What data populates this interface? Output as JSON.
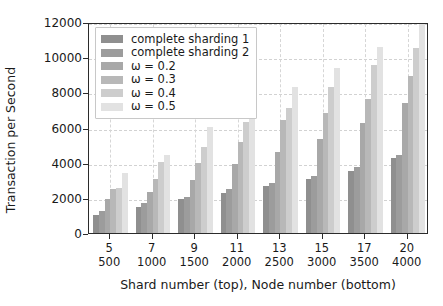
{
  "chart_data": {
    "type": "bar",
    "title": "",
    "xlabel": "Shard number (top), Node number (bottom)",
    "ylabel": "Transaction per Second",
    "categories": [
      "5\n500",
      "7\n1000",
      "9\n1500",
      "11\n2000",
      "13\n2500",
      "15\n3000",
      "17\n3500",
      "20\n4000"
    ],
    "shard_numbers": [
      "5",
      "7",
      "9",
      "11",
      "13",
      "15",
      "17",
      "20"
    ],
    "node_numbers": [
      "500",
      "1000",
      "1500",
      "2000",
      "2500",
      "3000",
      "3500",
      "4000"
    ],
    "ylim": [
      0,
      12000
    ],
    "yticks": [
      0,
      2000,
      4000,
      6000,
      8000,
      10000,
      12000
    ],
    "ytick_labels": [
      "0",
      "2000",
      "4000",
      "6000",
      "8000",
      "10000",
      "12000"
    ],
    "grid": true,
    "legend_position": "upper left",
    "series": [
      {
        "name": "complete sharding 1",
        "color": "#8f8f8f",
        "values": [
          1050,
          1500,
          1950,
          2300,
          2700,
          3100,
          3500,
          4250
        ]
      },
      {
        "name": "complete sharding 2",
        "color": "#9c9c9c",
        "values": [
          1280,
          1700,
          2050,
          2500,
          2850,
          3250,
          3750,
          4450
        ]
      },
      {
        "name": "ω = 0.2",
        "color": "#a8a8a8",
        "values": [
          1950,
          2350,
          3000,
          3900,
          4600,
          5350,
          6250,
          7400
        ]
      },
      {
        "name": "ω = 0.3",
        "color": "#b8b8b8",
        "values": [
          2500,
          3100,
          4000,
          5200,
          6400,
          6800,
          7650,
          8950
        ]
      },
      {
        "name": "ω = 0.4",
        "color": "#cdcdcd",
        "values": [
          2550,
          4050,
          4900,
          6300,
          7100,
          8300,
          9550,
          10500
        ]
      },
      {
        "name": "ω = 0.5",
        "color": "#e2e2e2",
        "values": [
          3400,
          4450,
          6050,
          7500,
          8300,
          9400,
          10600,
          12050
        ]
      }
    ]
  },
  "legend": {
    "entries": [
      "complete sharding 1",
      "complete sharding 2",
      "ω = 0.2",
      "ω = 0.3",
      "ω = 0.4",
      "ω = 0.5"
    ]
  },
  "axes": {
    "y_title": "Transaction per Second",
    "x_title": "Shard number (top), Node number (bottom)"
  }
}
